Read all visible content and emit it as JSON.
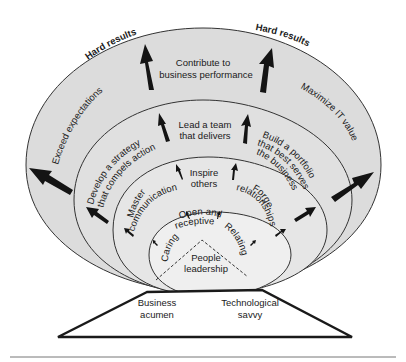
{
  "diagram": {
    "colors": {
      "ring_fill": "#dcdcdc",
      "inner_fill": "#eeeeee",
      "stroke": "#333333",
      "arrow": "#141414",
      "text": "#1a1a1a"
    },
    "outer_ring": {
      "top_labels": [
        "Hard results",
        "Hard results"
      ],
      "center_label_line1": "Contribute to",
      "center_label_line2": "business performance",
      "left_label": "Exceed expectations",
      "right_label": "Maximize IT value"
    },
    "second_ring": {
      "center_label_line1": "Lead a team",
      "center_label_line2": "that delivers",
      "left_label_line1": "Develop a strategy",
      "left_label_line2": "that compels action",
      "right_label_line1": "Build a portfolio",
      "right_label_line2": "that best serves",
      "right_label_line3": "the business"
    },
    "third_ring": {
      "center_label_line1": "Inspire",
      "center_label_line2": "others",
      "left_label_line1": "Master",
      "left_label_line2": "communications",
      "right_label_line1": "Forge",
      "right_label_line2": "relationships"
    },
    "inner_core": {
      "top_label_line1": "Open and",
      "top_label_line2": "receptive",
      "left_label": "Caring",
      "right_label": "Relating",
      "center_label_line1": "People",
      "center_label_line2": "leadership"
    },
    "foundation": {
      "left_label_line1": "Business",
      "left_label_line2": "acumen",
      "right_label_line1": "Technological",
      "right_label_line2": "savvy"
    }
  }
}
